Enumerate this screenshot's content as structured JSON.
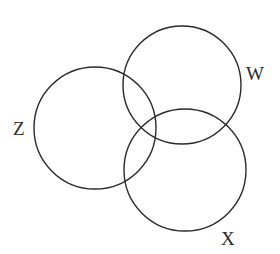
{
  "diagram": {
    "type": "venn",
    "sets": [
      {
        "id": "Z",
        "label": "Z",
        "cx": 95,
        "cy": 128,
        "r": 61,
        "label_x": 13,
        "label_y": 135
      },
      {
        "id": "W",
        "label": "W",
        "cx": 182,
        "cy": 85,
        "r": 59,
        "label_x": 246,
        "label_y": 80
      },
      {
        "id": "X",
        "label": "X",
        "cx": 185,
        "cy": 170,
        "r": 61,
        "label_x": 221,
        "label_y": 245
      }
    ],
    "stroke_color": "#2a2a2a",
    "background": "#ffffff"
  }
}
